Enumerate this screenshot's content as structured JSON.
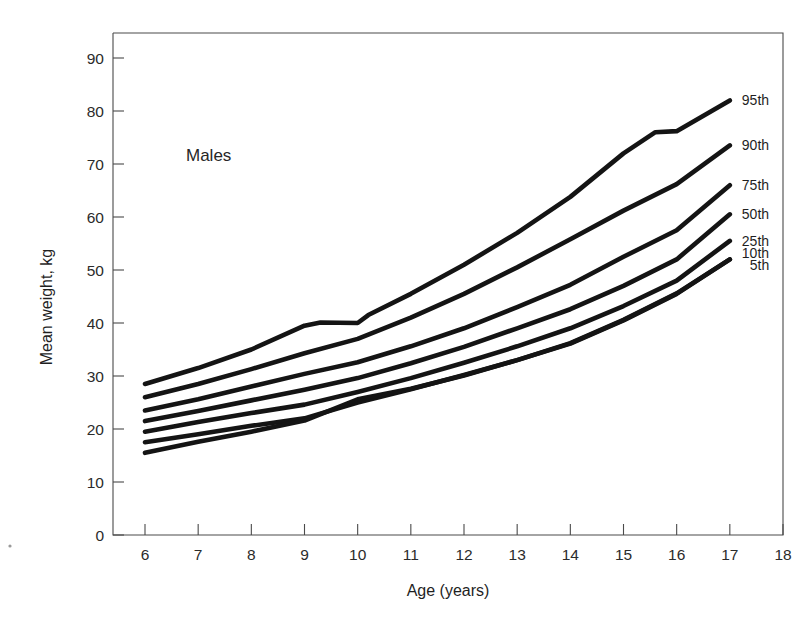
{
  "chart_data": {
    "type": "line",
    "title": "",
    "annotation": "Males",
    "xlabel": "Age (years)",
    "ylabel": "Mean weight, kg",
    "xlim": [
      6,
      18
    ],
    "ylim": [
      0,
      95
    ],
    "xticks": [
      6,
      7,
      8,
      9,
      10,
      11,
      12,
      13,
      14,
      15,
      16,
      17,
      18
    ],
    "yticks": [
      0,
      10,
      20,
      30,
      40,
      50,
      60,
      70,
      80,
      90
    ],
    "grid": false,
    "legend_position": "right-inline-end-of-line",
    "x": [
      6,
      7,
      8,
      9,
      10,
      11,
      12,
      13,
      14,
      15,
      16,
      17
    ],
    "series": [
      {
        "name": "95th",
        "label": "95th",
        "values": [
          28.5,
          31.5,
          35.0,
          39.5,
          40.0,
          45.5,
          51.0,
          57.0,
          63.5,
          71.5,
          78.0,
          82.0
        ]
      },
      {
        "name": "90th",
        "label": "90th",
        "values": [
          26.0,
          28.5,
          31.5,
          34.5,
          37.0,
          41.0,
          45.5,
          50.5,
          55.5,
          61.0,
          66.0,
          73.5
        ]
      },
      {
        "name": "75th",
        "label": "75th",
        "values": [
          23.5,
          25.5,
          28.0,
          30.5,
          32.5,
          35.5,
          39.0,
          43.0,
          47.0,
          52.5,
          57.5,
          66.0
        ]
      },
      {
        "name": "50th",
        "label": "50th",
        "values": [
          21.5,
          23.5,
          25.5,
          27.5,
          29.5,
          32.5,
          35.5,
          39.0,
          42.5,
          47.0,
          52.0,
          60.5
        ]
      },
      {
        "name": "25th",
        "label": "25th",
        "values": [
          19.5,
          21.5,
          23.0,
          24.5,
          27.0,
          29.5,
          32.5,
          35.5,
          39.0,
          43.0,
          48.0,
          55.5
        ]
      },
      {
        "name": "10th",
        "label": "10th",
        "values": [
          17.5,
          19.0,
          20.5,
          22.0,
          25.0,
          27.5,
          30.0,
          33.0,
          36.0,
          40.5,
          45.5,
          52.0
        ]
      },
      {
        "name": "5th",
        "label": "5th",
        "values": [
          15.5,
          17.5,
          19.5,
          21.5,
          25.5,
          27.5,
          30.0,
          33.0,
          36.0,
          40.5,
          45.5,
          52.0
        ]
      }
    ],
    "series_detailed_paths": {
      "95th": [
        [
          6,
          28.5
        ],
        [
          7,
          31.5
        ],
        [
          8,
          35.0
        ],
        [
          9,
          39.5
        ],
        [
          9.3,
          40.1
        ],
        [
          10,
          40.0
        ],
        [
          10.2,
          41.5
        ],
        [
          11,
          45.5
        ],
        [
          12,
          51.0
        ],
        [
          13,
          57.0
        ],
        [
          14,
          63.8
        ],
        [
          15,
          72.0
        ],
        [
          15.6,
          76.0
        ],
        [
          16,
          76.2
        ],
        [
          17,
          82.0
        ]
      ],
      "90th": [
        [
          6,
          26.0
        ],
        [
          7,
          28.5
        ],
        [
          8,
          31.3
        ],
        [
          9,
          34.3
        ],
        [
          10,
          37.0
        ],
        [
          11,
          41.0
        ],
        [
          12,
          45.5
        ],
        [
          13,
          50.5
        ],
        [
          14,
          55.8
        ],
        [
          15,
          61.2
        ],
        [
          16,
          66.2
        ],
        [
          17,
          73.5
        ]
      ],
      "75th": [
        [
          6,
          23.5
        ],
        [
          7,
          25.6
        ],
        [
          8,
          28.0
        ],
        [
          9,
          30.4
        ],
        [
          10,
          32.6
        ],
        [
          11,
          35.6
        ],
        [
          12,
          39.0
        ],
        [
          13,
          43.0
        ],
        [
          14,
          47.2
        ],
        [
          15,
          52.5
        ],
        [
          16,
          57.5
        ],
        [
          17,
          66.0
        ]
      ],
      "50th": [
        [
          6,
          21.5
        ],
        [
          7,
          23.4
        ],
        [
          8,
          25.4
        ],
        [
          9,
          27.4
        ],
        [
          10,
          29.6
        ],
        [
          11,
          32.4
        ],
        [
          12,
          35.5
        ],
        [
          13,
          39.0
        ],
        [
          14,
          42.6
        ],
        [
          15,
          47.0
        ],
        [
          16,
          52.0
        ],
        [
          17,
          60.5
        ]
      ],
      "25th": [
        [
          6,
          19.5
        ],
        [
          7,
          21.3
        ],
        [
          8,
          23.0
        ],
        [
          9,
          24.6
        ],
        [
          10,
          27.0
        ],
        [
          11,
          29.6
        ],
        [
          12,
          32.5
        ],
        [
          13,
          35.6
        ],
        [
          14,
          39.0
        ],
        [
          15,
          43.2
        ],
        [
          16,
          48.0
        ],
        [
          17,
          55.5
        ]
      ],
      "10th": [
        [
          6,
          17.5
        ],
        [
          7,
          19.0
        ],
        [
          8,
          20.6
        ],
        [
          9,
          22.0
        ],
        [
          10,
          25.0
        ],
        [
          11,
          27.5
        ],
        [
          12,
          30.2
        ],
        [
          13,
          33.0
        ],
        [
          14,
          36.2
        ],
        [
          15,
          40.6
        ],
        [
          16,
          45.6
        ],
        [
          17,
          52.0
        ]
      ],
      "5th": [
        [
          6,
          15.5
        ],
        [
          7,
          17.6
        ],
        [
          8,
          19.5
        ],
        [
          9,
          21.6
        ],
        [
          10,
          25.6
        ],
        [
          11,
          27.6
        ],
        [
          12,
          30.1
        ],
        [
          13,
          33.0
        ],
        [
          14,
          36.1
        ],
        [
          15,
          40.5
        ],
        [
          16,
          45.5
        ],
        [
          17,
          52.0
        ]
      ]
    }
  },
  "chart": {
    "annotation": "Males",
    "xlabel": "Age (years)",
    "ylabel": "Mean weight, kg"
  },
  "legend": {
    "items": [
      {
        "label": "95th"
      },
      {
        "label": "90th"
      },
      {
        "label": "75th"
      },
      {
        "label": "50th"
      },
      {
        "label": "25th"
      },
      {
        "label": "10th"
      },
      {
        "label": "5th"
      }
    ]
  },
  "axes": {
    "x_tick_labels": [
      "6",
      "7",
      "8",
      "9",
      "10",
      "11",
      "12",
      "13",
      "14",
      "15",
      "16",
      "17",
      "18"
    ],
    "y_tick_labels": [
      "0",
      "10",
      "20",
      "30",
      "40",
      "50",
      "60",
      "70",
      "80",
      "90"
    ]
  }
}
